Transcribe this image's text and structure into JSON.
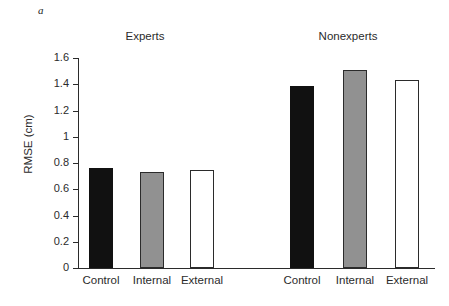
{
  "panel": {
    "letter": "a"
  },
  "chart_data": {
    "type": "bar",
    "title": "",
    "xlabel": "",
    "ylabel": "RMSE (cm)",
    "ylim": [
      0,
      1.6
    ],
    "ytick_labels": [
      "1.6",
      "1.4",
      "1.2",
      "1",
      "0.8",
      "0.6",
      "0.4",
      "0.2",
      "0"
    ],
    "ytick_values": [
      1.6,
      1.4,
      1.2,
      1.0,
      0.8,
      0.6,
      0.4,
      0.2,
      0
    ],
    "grid": false,
    "legend": "none",
    "groups": [
      "Experts",
      "Nonexperts"
    ],
    "categories": [
      "Control",
      "Internal",
      "External"
    ],
    "series": [
      {
        "name": "Experts",
        "values": [
          0.76,
          0.73,
          0.75
        ]
      },
      {
        "name": "Nonexperts",
        "values": [
          1.39,
          1.51,
          1.43
        ]
      }
    ],
    "bars": [
      {
        "group": "Experts",
        "category": "Control",
        "value": 0.76,
        "fill": "black",
        "left": 89,
        "width": 24
      },
      {
        "group": "Experts",
        "category": "Internal",
        "value": 0.73,
        "fill": "gray",
        "left": 140,
        "width": 24
      },
      {
        "group": "Experts",
        "category": "External",
        "value": 0.75,
        "fill": "white",
        "left": 190,
        "width": 24
      },
      {
        "group": "Nonexperts",
        "category": "Control",
        "value": 1.39,
        "fill": "black",
        "left": 290,
        "width": 24
      },
      {
        "group": "Nonexperts",
        "category": "Internal",
        "value": 1.51,
        "fill": "gray",
        "left": 343,
        "width": 24
      },
      {
        "group": "Nonexperts",
        "category": "External",
        "value": 1.43,
        "fill": "white",
        "left": 395,
        "width": 24
      }
    ],
    "colors": {
      "control_fill": "#111111",
      "internal_fill": "#919191",
      "external_fill": "#ffffff",
      "axis": "#2b2b2b",
      "background": "#ffffff"
    }
  },
  "axis": {
    "y_label": "RMSE (cm)",
    "ticks": [
      "1.6",
      "1.4",
      "1.2",
      "1",
      "0.8",
      "0.6",
      "0.4",
      "0.2",
      "0"
    ]
  },
  "groups": {
    "experts_label": "Experts",
    "nonexperts_label": "Nonexperts"
  },
  "x_labels": {
    "experts": [
      "Control",
      "Internal",
      "External"
    ],
    "nonexperts": [
      "Control",
      "Internal",
      "External"
    ]
  }
}
